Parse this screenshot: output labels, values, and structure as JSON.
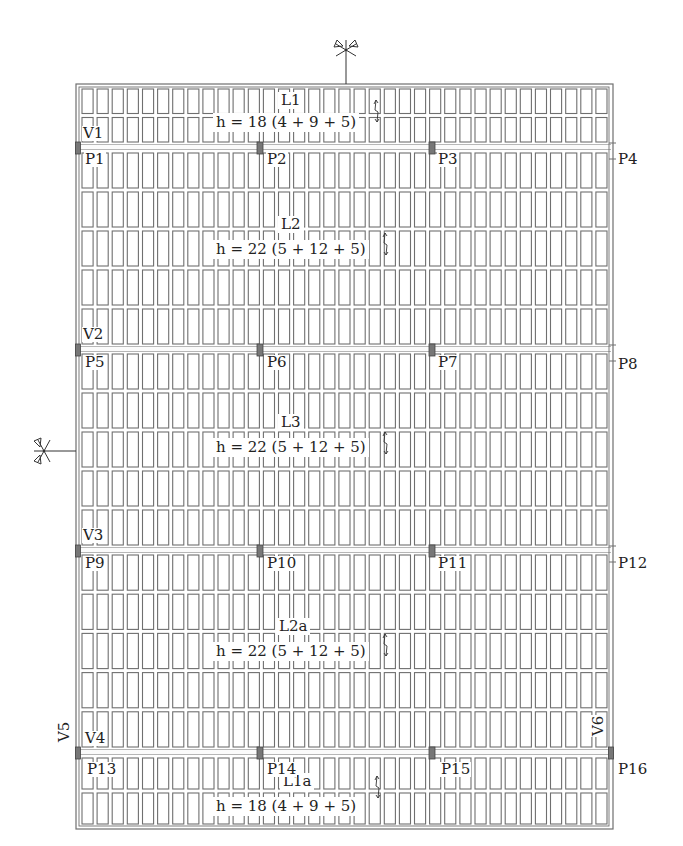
{
  "colors": {
    "line": "#6f6f6f",
    "pillar": "#777777",
    "text": "#222222",
    "background": "#ffffff"
  },
  "slabs": [
    {
      "id": "L1",
      "label": "L1",
      "height_text": "h = 18 (4 + 9 + 5)"
    },
    {
      "id": "L2",
      "label": "L2",
      "height_text": "h = 22 (5 + 12 + 5)"
    },
    {
      "id": "L3",
      "label": "L3",
      "height_text": "h = 22 (5 + 12 + 5)"
    },
    {
      "id": "L2a",
      "label": "L2a",
      "height_text": "h = 22 (5 + 12 + 5)"
    },
    {
      "id": "L1a",
      "label": "L1a",
      "height_text": "h = 18 (4 + 9 + 5)"
    }
  ],
  "beams": [
    {
      "id": "V1",
      "label": "V1",
      "orientation": "horizontal"
    },
    {
      "id": "V2",
      "label": "V2",
      "orientation": "horizontal"
    },
    {
      "id": "V3",
      "label": "V3",
      "orientation": "horizontal"
    },
    {
      "id": "V4",
      "label": "V4",
      "orientation": "horizontal"
    },
    {
      "id": "V5",
      "label": "V5",
      "orientation": "vertical"
    },
    {
      "id": "V6",
      "label": "V6",
      "orientation": "vertical"
    }
  ],
  "pillars": [
    {
      "label": "P1"
    },
    {
      "label": "P2"
    },
    {
      "label": "P3"
    },
    {
      "label": "P4"
    },
    {
      "label": "P5"
    },
    {
      "label": "P6"
    },
    {
      "label": "P7"
    },
    {
      "label": "P8"
    },
    {
      "label": "P9"
    },
    {
      "label": "P10"
    },
    {
      "label": "P11"
    },
    {
      "label": "P12"
    },
    {
      "label": "P13"
    },
    {
      "label": "P14"
    },
    {
      "label": "P15"
    },
    {
      "label": "P16"
    }
  ],
  "section_cuts": [
    {
      "name": "section-cut-top",
      "orientation": "vertical"
    },
    {
      "name": "section-cut-left",
      "orientation": "horizontal"
    }
  ],
  "grid": {
    "columns": 35,
    "rows_top_band": 2,
    "rows_between_beams": 5,
    "rows_bottom_band": 2
  }
}
